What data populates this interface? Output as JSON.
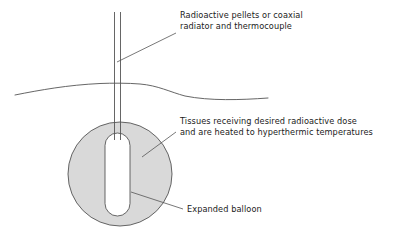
{
  "figure": {
    "background_color": "#ffffff",
    "line_color": "#4a4a4a",
    "tissue_fill_color": "#d9d9d9",
    "balloon_fill_color": "#ffffff",
    "text_color": "#1b1b1b"
  },
  "annotations": [
    {
      "name": "source-label",
      "lines": [
        "Radioactive pellets or coaxial",
        "radiator and thermocouple"
      ],
      "x": 180,
      "y": 18
    },
    {
      "name": "tissue-label",
      "lines": [
        "Tissues receiving desired radioactive dose",
        "and are heated to hyperthermic temperatures"
      ],
      "x": 180,
      "y": 124
    },
    {
      "name": "balloon-label",
      "lines": [
        "Expanded balloon"
      ],
      "x": 187,
      "y": 209
    }
  ],
  "parts": {
    "catheter": {
      "name": "catheter-shaft",
      "left_line_x": 114.5,
      "right_line_x": 120.5,
      "top_y": 12,
      "bottom_y": 140
    },
    "skin_line": {
      "name": "skin-surface-line",
      "start_x": 15,
      "end_x": 268,
      "peak_y": 83,
      "dip_y": 99
    },
    "tissue_circle": {
      "name": "tissue-region",
      "center_x": 120,
      "center_y": 174,
      "radius": 52
    },
    "balloon": {
      "name": "expanded-balloon",
      "left_x": 105,
      "right_x": 130,
      "top_y": 133,
      "bottom_y": 216,
      "corner_radius": 12.5
    }
  },
  "leaders": [
    {
      "name": "leader-source",
      "x1": 117,
      "y1": 62,
      "x2": 176,
      "y2": 33
    },
    {
      "name": "leader-tissue",
      "x1": 142,
      "y1": 157,
      "x2": 176,
      "y2": 132
    },
    {
      "name": "leader-balloon",
      "x1": 131,
      "y1": 192,
      "x2": 183,
      "y2": 209
    }
  ]
}
